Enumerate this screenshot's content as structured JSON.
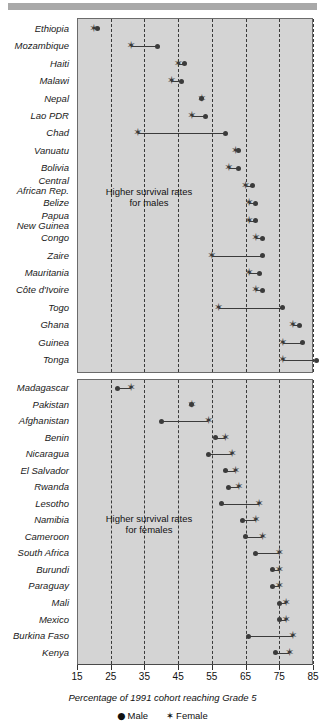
{
  "chart_data": {
    "type": "scatter",
    "title": "",
    "xlabel": "Percentage of 1991 cohort reaching Grade 5",
    "ylabel": "",
    "xlim": [
      15,
      85
    ],
    "xticks": [
      15,
      25,
      35,
      45,
      55,
      65,
      75,
      85
    ],
    "grid": "vertical dashed gridlines at every tick except 15",
    "legend": {
      "position": "bottom-center",
      "entries": [
        {
          "label": "Male",
          "marker": "filled-circle",
          "glyph": "●",
          "color": "#3b3b3b"
        },
        {
          "label": "Female",
          "marker": "star",
          "glyph": "✶",
          "color": "#3b3b3b"
        }
      ]
    },
    "series": [
      {
        "name": "Male",
        "marker": "dot"
      },
      {
        "name": "Female",
        "marker": "star"
      }
    ],
    "panels": [
      {
        "id": "higher-survival-males",
        "annotation": "Higher survival rates\nfor males",
        "annotation_line1": "Higher survival rates",
        "annotation_line2": "for males",
        "rows": [
          {
            "category": "Ethiopia",
            "male": 21,
            "female": 20
          },
          {
            "category": "Mozambique",
            "male": 39,
            "female": 31
          },
          {
            "category": "Haiti",
            "male": 47,
            "female": 45
          },
          {
            "category": "Malawi",
            "male": 46,
            "female": 43
          },
          {
            "category": "Nepal",
            "male": 52,
            "female": 52
          },
          {
            "category": "Lao PDR",
            "male": 53,
            "female": 49
          },
          {
            "category": "Chad",
            "male": 59,
            "female": 33
          },
          {
            "category": "Vanuatu",
            "male": 63,
            "female": 62
          },
          {
            "category": "Bolivia",
            "male": 63,
            "female": 60
          },
          {
            "category": "Central African Rep.",
            "male": 67,
            "female": 65
          },
          {
            "category": "Belize",
            "male": 68,
            "female": 66
          },
          {
            "category": "Papua New Guinea",
            "male": 68,
            "female": 66
          },
          {
            "category": "Congo",
            "male": 70,
            "female": 68
          },
          {
            "category": "Zaire",
            "male": 70,
            "female": 55
          },
          {
            "category": "Mauritania",
            "male": 69,
            "female": 66
          },
          {
            "category": "Côte d'Ivoire",
            "male": 70,
            "female": 68
          },
          {
            "category": "Togo",
            "male": 76,
            "female": 57
          },
          {
            "category": "Ghana",
            "male": 81,
            "female": 79
          },
          {
            "category": "Guinea",
            "male": 82,
            "female": 76
          },
          {
            "category": "Tonga",
            "male": 86,
            "female": 76
          }
        ]
      },
      {
        "id": "higher-survival-females",
        "annotation": "Higher survival rates\nfor females",
        "annotation_line1": "Higher survival rates",
        "annotation_line2": "for females",
        "rows": [
          {
            "category": "Madagascar",
            "male": 27,
            "female": 31
          },
          {
            "category": "Pakistan",
            "male": 49,
            "female": 49
          },
          {
            "category": "Afghanistan",
            "male": 40,
            "female": 54
          },
          {
            "category": "Benin",
            "male": 56,
            "female": 59
          },
          {
            "category": "Nicaragua",
            "male": 54,
            "female": 61
          },
          {
            "category": "El Salvador",
            "male": 59,
            "female": 62
          },
          {
            "category": "Rwanda",
            "male": 60,
            "female": 63
          },
          {
            "category": "Lesotho",
            "male": 58,
            "female": 69
          },
          {
            "category": "Namibia",
            "male": 64,
            "female": 68
          },
          {
            "category": "Cameroon",
            "male": 65,
            "female": 70
          },
          {
            "category": "South Africa",
            "male": 68,
            "female": 75
          },
          {
            "category": "Burundi",
            "male": 73,
            "female": 75
          },
          {
            "category": "Paraguay",
            "male": 73,
            "female": 75
          },
          {
            "category": "Mali",
            "male": 75,
            "female": 77
          },
          {
            "category": "Mexico",
            "male": 75,
            "female": 77
          },
          {
            "category": "Burkina Faso",
            "male": 66,
            "female": 79
          },
          {
            "category": "Kenya",
            "male": 74,
            "female": 78
          }
        ]
      }
    ]
  },
  "axis": {
    "tick_labels": [
      "15",
      "25",
      "35",
      "45",
      "55",
      "65",
      "75",
      "85"
    ],
    "xlabel": "Percentage of 1991 cohort reaching Grade 5"
  },
  "legend": {
    "male_label": "Male",
    "female_label": "Female",
    "male_glyph": "●",
    "female_glyph": "✶"
  },
  "colors": {
    "panel_background": "#d4d4d4",
    "marker": "#3b3b3b",
    "gridline": "#3a3a3a",
    "page_background": "#ffffff",
    "top_bar": "#a9a9a9"
  },
  "labels": {
    "top_panel": [
      "Ethiopia",
      "Mozambique",
      "Haiti",
      "Malawi",
      "Nepal",
      "Lao PDR",
      "Chad",
      "Vanuatu",
      "Bolivia",
      "Central|African Rep.",
      "Belize",
      "Papua|New Guinea",
      "Congo",
      "Zaire",
      "Mauritania",
      "Côte d'Ivoire",
      "Togo",
      "Ghana",
      "Guinea",
      "Tonga"
    ],
    "bottom_panel": [
      "Madagascar",
      "Pakistan",
      "Afghanistan",
      "Benin",
      "Nicaragua",
      "El Salvador",
      "Rwanda",
      "Lesotho",
      "Namibia",
      "Cameroon",
      "South Africa",
      "Burundi",
      "Paraguay",
      "Mali",
      "Mexico",
      "Burkina Faso",
      "Kenya"
    ]
  }
}
